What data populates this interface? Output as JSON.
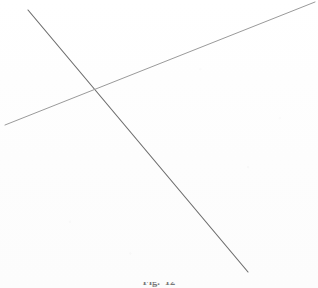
{
  "figure": {
    "kind": "line-drawing",
    "background_color": "#ffffff",
    "width": 318,
    "height": 288,
    "caption": {
      "label": "Fig.",
      "number": "12",
      "clipped": true
    },
    "elements": [
      {
        "name": "descending-line",
        "description": "long straight line running from upper-left down to lower-right",
        "color": "#6d6d6d",
        "stroke_width": 1.15,
        "x1": 28,
        "y1": 10,
        "x2": 248,
        "y2": 272
      },
      {
        "name": "ascending-line",
        "description": "long straight line running from lower-left up to upper-right",
        "color": "#9a9a9a",
        "stroke_width": 1.0,
        "x1": 5,
        "y1": 125,
        "x2": 315,
        "y2": 2
      }
    ],
    "intersection": {
      "name": "crossing-point",
      "x": 95,
      "y": 93
    }
  }
}
